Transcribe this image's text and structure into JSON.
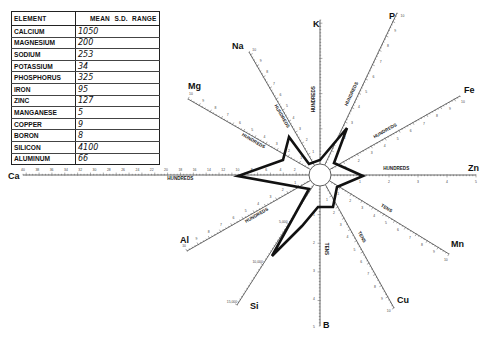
{
  "table": {
    "headers": [
      "ELEMENT",
      "MEAN",
      "S.D.",
      "RANGE"
    ],
    "rows": [
      {
        "element": "CALCIUM",
        "mean": "1050",
        "sd": "",
        "range": ""
      },
      {
        "element": "MAGNESIUM",
        "mean": "200",
        "sd": "",
        "range": ""
      },
      {
        "element": "SODIUM",
        "mean": "253",
        "sd": "",
        "range": ""
      },
      {
        "element": "POTASSIUM",
        "mean": "34",
        "sd": "",
        "range": ""
      },
      {
        "element": "PHOSPHORUS",
        "mean": "325",
        "sd": "",
        "range": ""
      },
      {
        "element": "IRON",
        "mean": "95",
        "sd": "",
        "range": ""
      },
      {
        "element": "ZINC",
        "mean": "127",
        "sd": "",
        "range": ""
      },
      {
        "element": "MANGANESE",
        "mean": "5",
        "sd": "",
        "range": ""
      },
      {
        "element": "COPPER",
        "mean": "9",
        "sd": "",
        "range": ""
      },
      {
        "element": "BORON",
        "mean": "8",
        "sd": "",
        "range": ""
      },
      {
        "element": "SILICON",
        "mean": "4100",
        "sd": "",
        "range": ""
      },
      {
        "element": "ALUMINUM",
        "mean": "66",
        "sd": "",
        "range": ""
      }
    ]
  },
  "chart_data": {
    "type": "radar",
    "title": "",
    "center": [
      320,
      175
    ],
    "hub_radius": 11,
    "axes": [
      {
        "label": "K",
        "unit": "HUNDREDS",
        "end": [
          320,
          20
        ],
        "label_pos": [
          313,
          27
        ],
        "ticks": [
          "",
          "",
          "",
          ""
        ],
        "value": 34
      },
      {
        "label": "P",
        "unit": "HUNDREDS",
        "end": [
          397,
          13
        ],
        "label_pos": [
          389,
          19
        ],
        "ticks": [
          "1",
          "2",
          "3",
          "4",
          "5",
          "6",
          "7",
          "8",
          "9",
          "10"
        ],
        "value": 325
      },
      {
        "label": "Fe",
        "unit": "HUNDREDS",
        "end": [
          460,
          96
        ],
        "label_pos": [
          464,
          93
        ],
        "ticks": [
          "1",
          "2",
          "3",
          "4",
          "5",
          "6",
          "7",
          "8",
          "9",
          "10"
        ],
        "value": 95
      },
      {
        "label": "Zn",
        "unit": "HUNDREDS",
        "end": [
          476,
          175
        ],
        "label_pos": [
          468,
          171
        ],
        "ticks": [
          "1",
          "2",
          "3",
          "4",
          "5"
        ],
        "value": 127
      },
      {
        "label": "Mn",
        "unit": "TENS",
        "end": [
          449,
          254
        ],
        "label_pos": [
          451,
          247
        ],
        "ticks": [
          "1",
          "2",
          "3",
          "4",
          "5",
          "6",
          "7",
          "8",
          "9",
          "10"
        ],
        "value": 5
      },
      {
        "label": "Cu",
        "unit": "TENS",
        "end": [
          394,
          308
        ],
        "label_pos": [
          397,
          303
        ],
        "ticks": [
          "1",
          "2",
          "3",
          "4",
          "5",
          "6",
          "7",
          "8",
          "9",
          "10"
        ],
        "value": 9
      },
      {
        "label": "B",
        "unit": "TENS",
        "end": [
          320,
          326
        ],
        "label_pos": [
          323,
          328
        ],
        "ticks": [
          "1",
          "2",
          "3",
          "4",
          "5"
        ],
        "value": 8
      },
      {
        "label": "Si",
        "unit": "",
        "end": [
          237,
          305
        ],
        "label_pos": [
          250,
          309
        ],
        "ticks": [
          "5,000",
          "10,000",
          "15,000"
        ],
        "value": 4100
      },
      {
        "label": "Al",
        "unit": "HUNDREDS",
        "end": [
          187,
          251
        ],
        "label_pos": [
          180,
          243
        ],
        "ticks": [
          "1",
          "2",
          "3",
          "4",
          "5",
          "6",
          "7",
          "8",
          "9",
          "10"
        ],
        "value": 66
      },
      {
        "label": "Ca",
        "unit": "HUNDREDS",
        "end": [
          23,
          175
        ],
        "label_pos": [
          8,
          179
        ],
        "ticks": [
          "2",
          "4",
          "6",
          "8",
          "10",
          "12",
          "14",
          "16",
          "18",
          "20",
          "22",
          "24",
          "26",
          "28",
          "30",
          "32",
          "34",
          "36",
          "38",
          "40"
        ],
        "value": 1050
      },
      {
        "label": "Mg",
        "unit": "HUNDREDS",
        "end": [
          188,
          99
        ],
        "label_pos": [
          188,
          89
        ],
        "ticks": [
          "1",
          "2",
          "3",
          "4",
          "5",
          "6",
          "7",
          "8",
          "9",
          "10"
        ],
        "value": 200
      },
      {
        "label": "Na",
        "unit": "HUNDREDS",
        "end": [
          249,
          52
        ],
        "label_pos": [
          232,
          49
        ],
        "ticks": [
          "1",
          "2",
          "3",
          "4",
          "5",
          "6",
          "7",
          "8",
          "9",
          "10"
        ],
        "value": 253
      }
    ],
    "polygon": [
      [
        320,
        160
      ],
      [
        347,
        128
      ],
      [
        334,
        163
      ],
      [
        363,
        176
      ],
      [
        337,
        187
      ],
      [
        333,
        207
      ],
      [
        318,
        207
      ],
      [
        302,
        226
      ],
      [
        272,
        256
      ],
      [
        309,
        189
      ],
      [
        238,
        176
      ],
      [
        283,
        160
      ],
      [
        289,
        137
      ],
      [
        309,
        164
      ]
    ],
    "grid": false,
    "legend": "table top-left"
  }
}
